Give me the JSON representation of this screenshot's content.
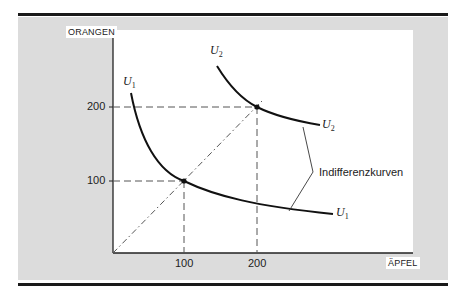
{
  "figure": {
    "y_axis": {
      "title": "ORANGEN",
      "ticks": [
        "100",
        "200"
      ]
    },
    "x_axis": {
      "title": "ÄPFEL",
      "ticks": [
        "100",
        "200"
      ]
    },
    "curves": [
      {
        "name": "U",
        "sub": "1",
        "label_top": "U",
        "label_end": "U"
      },
      {
        "name": "U",
        "sub": "2",
        "label_top": "U",
        "label_end": "U"
      }
    ],
    "annotation": "Indifferenzkurven",
    "points": [
      {
        "apples": 100,
        "oranges": 100
      },
      {
        "apples": 200,
        "oranges": 200
      }
    ],
    "colors": {
      "panel": "#dcdcdc",
      "plot": "#ffffff",
      "ink": "#1a1a1a"
    }
  }
}
